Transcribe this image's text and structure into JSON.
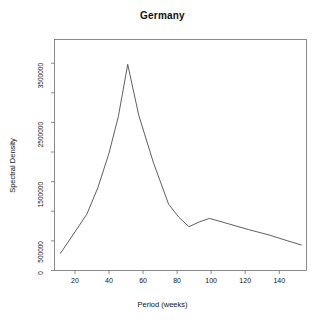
{
  "chart_data": {
    "type": "line",
    "title": "Germany",
    "xlabel": "Period (weeks)",
    "ylabel": "Spectral Density",
    "grid": false,
    "legend": null,
    "xlim": [
      8,
      156
    ],
    "ylim": [
      0,
      3900000
    ],
    "xticks": [
      20,
      40,
      60,
      80,
      100,
      120,
      140
    ],
    "xtick_labels": [
      "20",
      "40",
      "60",
      "80",
      "100",
      "120",
      "140"
    ],
    "yticks": [
      0,
      500000,
      1500000,
      2500000,
      3500000
    ],
    "ytick_labels": [
      "0",
      "500000",
      "1500000",
      "2500000",
      "3500000"
    ],
    "yminorticks": [
      1000000,
      2000000,
      3000000
    ],
    "series": [
      {
        "name": "Spectral Density",
        "color": "#4d4d4d",
        "x": [
          11.5,
          27.0,
          33.5,
          40.0,
          45.5,
          51.0,
          57.5,
          66.0,
          75.0,
          81.0,
          87.0,
          93.0,
          99.0,
          110.0,
          122.0,
          134.0,
          145.0,
          153.0
        ],
        "y": [
          290000,
          950000,
          1400000,
          1980000,
          2600000,
          3480000,
          2620000,
          1830000,
          1120000,
          900000,
          740000,
          820000,
          880000,
          790000,
          690000,
          600000,
          500000,
          430000
        ]
      }
    ]
  }
}
